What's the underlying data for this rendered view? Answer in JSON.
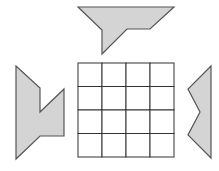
{
  "diagram": {
    "colors": {
      "background": "#ffffff",
      "shape_fill": "#d4d4d4",
      "shape_stroke": "#555555",
      "grid_stroke": "#333333"
    },
    "grid": {
      "rows": 4,
      "cols": 4,
      "x": 78,
      "y": 63,
      "cell": 24
    },
    "shapes": [
      {
        "name": "top-piece",
        "points": "78,7 174,7 150,29 127,29 102,54 102,30"
      },
      {
        "name": "left-piece",
        "points": "16,66 40,88 40,112 64,89 64,136 40,136 16,159"
      },
      {
        "name": "right-piece",
        "points": "211,66 211,158 188,135 200,112 188,89"
      }
    ]
  }
}
